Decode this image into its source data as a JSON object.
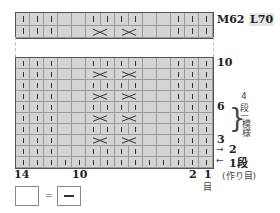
{
  "chart_title_labels": {
    "top_right": "M62",
    "top_right_2": "L70"
  },
  "grid": {
    "columns": 14,
    "top_rows": [
      "kkk__kkkk__kkk",
      "kkk__XXXX__kkk"
    ],
    "bottom_rows": [
      "kkk__kkkk__kkk",
      "kkk__XXXX__kkk",
      "kkk__kkkk__kkk",
      "kkk__XXXX__kkk",
      "kkk__kkkk__kkk",
      "kkk__XXXX__kkk",
      "kkk__kkkk__kkk",
      "kkk__XXXX__kkk",
      "kkk__kkkk__kkk",
      "kkkkkkkkkkkkkk"
    ]
  },
  "row_labels": {
    "r10": "10",
    "r6": "6",
    "r3": "3",
    "r2": "2",
    "r1": "1段"
  },
  "repeat_note": {
    "count": "4",
    "unit": "段",
    "dash": "|",
    "label": "模様"
  },
  "cast_on": "(作り目)",
  "col_labels": {
    "c14": "14",
    "c10": "10",
    "c2": "2",
    "c1": "1",
    "stitch": "目"
  },
  "legend": {
    "equals": "="
  }
}
